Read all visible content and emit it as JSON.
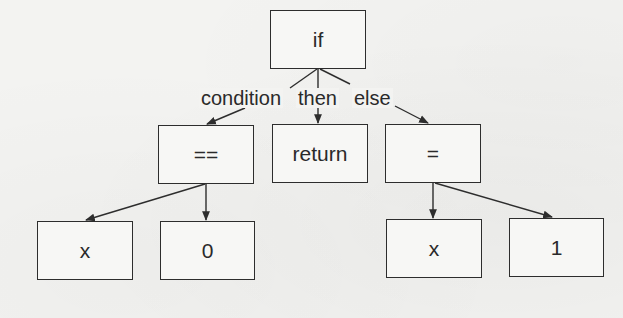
{
  "diagram": {
    "type": "abstract-syntax-tree",
    "colors": {
      "stroke": "#2d2d2d",
      "text": "#2a2a2a",
      "background": "#f3f3f1"
    },
    "nodes": {
      "if": {
        "label": "if"
      },
      "eq_compare": {
        "label": "=="
      },
      "return": {
        "label": "return"
      },
      "assign": {
        "label": "="
      },
      "x_left": {
        "label": "x"
      },
      "zero": {
        "label": "0"
      },
      "x_right": {
        "label": "x"
      },
      "one": {
        "label": "1"
      }
    },
    "edge_labels": {
      "condition": "condition",
      "then": "then",
      "else": "else"
    },
    "edges": [
      {
        "from": "if",
        "to": "eq_compare",
        "label": "condition"
      },
      {
        "from": "if",
        "to": "return",
        "label": "then"
      },
      {
        "from": "if",
        "to": "assign",
        "label": "else"
      },
      {
        "from": "eq_compare",
        "to": "x_left",
        "label": ""
      },
      {
        "from": "eq_compare",
        "to": "zero",
        "label": ""
      },
      {
        "from": "assign",
        "to": "x_right",
        "label": ""
      },
      {
        "from": "assign",
        "to": "one",
        "label": ""
      }
    ]
  }
}
